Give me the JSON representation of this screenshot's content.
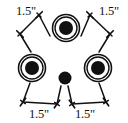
{
  "diagram": {
    "background_color": "#ffffff",
    "stroke_color": "#111111",
    "fill_color": "#111111",
    "canvas": {
      "width": 128,
      "height": 123
    },
    "nodes": [
      {
        "name": "top-center-ring-circle",
        "kind": "ringed-dot",
        "cx": 66,
        "cy": 28,
        "outer_r": 13.5,
        "inner_r": 11.0,
        "dot_r": 7.0
      },
      {
        "name": "left-ring-circle",
        "kind": "ringed-dot",
        "cx": 32,
        "cy": 68,
        "outer_r": 13.5,
        "inner_r": 11.0,
        "dot_r": 7.0
      },
      {
        "name": "right-ring-circle",
        "kind": "ringed-dot",
        "cx": 98,
        "cy": 68,
        "outer_r": 13.5,
        "inner_r": 11.0,
        "dot_r": 7.0
      },
      {
        "name": "bottom-center-dot",
        "kind": "plain-dot",
        "cx": 65,
        "cy": 78,
        "dot_r": 6.5
      }
    ],
    "dimensions": [
      {
        "name": "dimension-top-left",
        "label": "1.5\"",
        "label_x": 16,
        "label_y": 15,
        "leader": [
          {
            "x": 50,
            "y": 36
          },
          {
            "x": 39,
            "y": 15
          },
          {
            "x": 20,
            "y": 34
          },
          {
            "x": 31,
            "y": 52
          }
        ],
        "tick_points": [
          {
            "x": 39,
            "y": 15,
            "angle": -45
          },
          {
            "x": 20,
            "y": 34,
            "angle": 45
          }
        ]
      },
      {
        "name": "dimension-top-right",
        "label": "1.5\"",
        "label_x": 99,
        "label_y": 15,
        "leader": [
          {
            "x": 81,
            "y": 36
          },
          {
            "x": 90,
            "y": 15
          },
          {
            "x": 110,
            "y": 34
          },
          {
            "x": 99,
            "y": 52
          }
        ],
        "tick_points": [
          {
            "x": 90,
            "y": 15,
            "angle": 45
          },
          {
            "x": 110,
            "y": 34,
            "angle": -45
          }
        ]
      },
      {
        "name": "dimension-bottom-left",
        "label": "1.5\"",
        "label_x": 29,
        "label_y": 118,
        "leader": [
          {
            "x": 30,
            "y": 83
          },
          {
            "x": 23,
            "y": 102
          },
          {
            "x": 57,
            "y": 104
          },
          {
            "x": 61,
            "y": 86
          }
        ],
        "tick_points": [
          {
            "x": 23,
            "y": 102,
            "angle": -55
          },
          {
            "x": 57,
            "y": 104,
            "angle": -55
          }
        ]
      },
      {
        "name": "dimension-bottom-right",
        "label": "1.5\"",
        "label_x": 75,
        "label_y": 118,
        "leader": [
          {
            "x": 99,
            "y": 83
          },
          {
            "x": 106,
            "y": 102
          },
          {
            "x": 72,
            "y": 104
          },
          {
            "x": 68,
            "y": 86
          }
        ],
        "tick_points": [
          {
            "x": 106,
            "y": 102,
            "angle": 55
          },
          {
            "x": 72,
            "y": 104,
            "angle": 55
          }
        ]
      }
    ],
    "labels": {
      "top_left": "1.5\"",
      "top_right": "1.5\"",
      "bottom_left": "1.5\"",
      "bottom_right": "1.5\""
    }
  }
}
